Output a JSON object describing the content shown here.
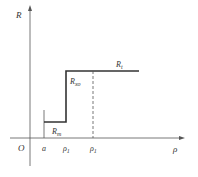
{
  "diagram": {
    "y_axis_label": "R",
    "x_axis_label": "ρ",
    "origin_label": "O",
    "x_ticks": [
      {
        "label": "a",
        "sub": ""
      },
      {
        "label": "ρ",
        "sub": "1"
      },
      {
        "label": "ρ",
        "sub": "1"
      }
    ],
    "regions": [
      {
        "label": "R",
        "sub": "m"
      },
      {
        "label": "R",
        "sub": "xo"
      },
      {
        "label": "R",
        "sub": "t"
      }
    ],
    "colors": {
      "line": "#333333",
      "axis": "#555555"
    }
  }
}
